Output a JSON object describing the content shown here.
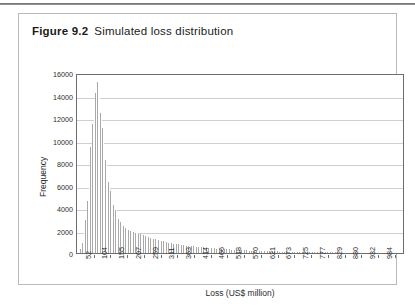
{
  "figure": {
    "number_label": "Figure 9.2",
    "caption": "Simulated loss distribution"
  },
  "chart_data": {
    "type": "bar",
    "title": "Simulated loss distribution",
    "xlabel": "Loss (US$ million)",
    "ylabel": "Frequency",
    "ylim": [
      0,
      16000
    ],
    "ytick_labels": [
      "16000",
      "14000",
      "12000",
      "10000",
      "8000",
      "6000",
      "4000",
      "2000",
      "0"
    ],
    "ytick_values": [
      16000,
      14000,
      12000,
      10000,
      8000,
      6000,
      4000,
      2000,
      0
    ],
    "grid": "horizontal",
    "legend": "none",
    "xtick_labels": [
      "52",
      "104",
      "155",
      "207",
      "259",
      "311",
      "363",
      "414",
      "466",
      "518",
      "570",
      "621",
      "673",
      "725",
      "777",
      "829",
      "880",
      "932",
      "984"
    ],
    "xtick_values": [
      52,
      104,
      155,
      207,
      259,
      311,
      363,
      414,
      466,
      518,
      570,
      621,
      673,
      725,
      777,
      829,
      880,
      932,
      984
    ],
    "xtick_positions": [
      10,
      20,
      30,
      40,
      50,
      60,
      70,
      80,
      90,
      100,
      110,
      120,
      130,
      140,
      150,
      160,
      170,
      180,
      190
    ],
    "bar_color": "#a9a9a9",
    "gridline_color": "#cfcfcf",
    "axis_color": "#6d6d6d",
    "bin_count": 196,
    "values": [
      30,
      120,
      360,
      900,
      1750,
      2900,
      4650,
      7000,
      9400,
      11450,
      12600,
      14200,
      15200,
      14050,
      12450,
      11150,
      9650,
      8300,
      7200,
      6350,
      5550,
      4900,
      4300,
      3800,
      3400,
      3050,
      2800,
      2600,
      2420,
      2260,
      2130,
      2030,
      1960,
      1900,
      1850,
      1800,
      1760,
      1720,
      1670,
      1620,
      1560,
      1500,
      1450,
      1400,
      1350,
      1300,
      1255,
      1215,
      1175,
      1135,
      1095,
      1060,
      1025,
      990,
      960,
      930,
      900,
      870,
      845,
      820,
      795,
      770,
      748,
      726,
      705,
      685,
      665,
      646,
      628,
      610,
      592,
      575,
      558,
      542,
      527,
      512,
      497,
      483,
      469,
      456,
      443,
      430,
      418,
      406,
      395,
      384,
      373,
      362,
      352,
      342,
      332,
      323,
      314,
      305,
      296,
      288,
      280,
      272,
      264,
      257,
      249,
      242,
      235,
      229,
      222,
      216,
      210,
      204,
      198,
      192,
      187,
      181,
      176,
      171,
      166,
      162,
      157,
      153,
      148,
      144,
      140,
      136,
      132,
      128,
      125,
      121,
      118,
      114,
      111,
      108,
      105,
      102,
      99,
      96,
      93,
      91,
      88,
      86,
      83,
      81,
      78,
      76,
      74,
      72,
      70,
      68,
      66,
      64,
      62,
      60,
      58,
      57,
      55,
      53,
      52,
      50,
      49,
      47,
      46,
      45,
      43,
      42,
      41,
      40,
      38,
      37,
      36,
      35,
      34,
      33,
      32,
      31,
      30,
      29,
      29,
      28,
      27,
      26,
      25,
      25,
      24,
      23,
      23,
      22,
      21,
      21,
      20,
      19,
      19,
      18,
      18,
      17,
      17,
      16,
      16,
      15
    ]
  }
}
